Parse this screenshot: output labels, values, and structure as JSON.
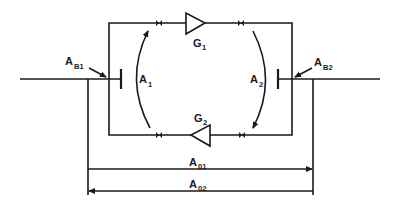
{
  "diagram": {
    "type": "two-way repeater loop with hybrid balance",
    "colors": {
      "line": "#1a1a1a",
      "background": "#ffffff"
    },
    "labels": {
      "AB1": {
        "main": "A",
        "sub": "B1"
      },
      "AB2": {
        "main": "A",
        "sub": "B2"
      },
      "A1": {
        "main": "A",
        "sub": "1"
      },
      "A2": {
        "main": "A",
        "sub": "2"
      },
      "G1": {
        "main": "G",
        "sub": "1"
      },
      "G2": {
        "main": "G",
        "sub": "2"
      },
      "A01": {
        "main": "A",
        "sub": "01"
      },
      "A02": {
        "main": "A",
        "sub": "02"
      }
    },
    "components": [
      {
        "id": "G1",
        "kind": "amplifier",
        "direction": "right"
      },
      {
        "id": "G2",
        "kind": "amplifier",
        "direction": "left"
      },
      {
        "id": "AB1",
        "kind": "balance-point"
      },
      {
        "id": "AB2",
        "kind": "balance-point"
      }
    ],
    "arrows": [
      {
        "id": "A1",
        "kind": "curved-arrow",
        "direction": "up"
      },
      {
        "id": "A2",
        "kind": "curved-arrow",
        "direction": "down"
      },
      {
        "id": "A01",
        "kind": "dimension-arrow",
        "direction": "right"
      },
      {
        "id": "A02",
        "kind": "dimension-arrow",
        "direction": "left"
      }
    ]
  }
}
